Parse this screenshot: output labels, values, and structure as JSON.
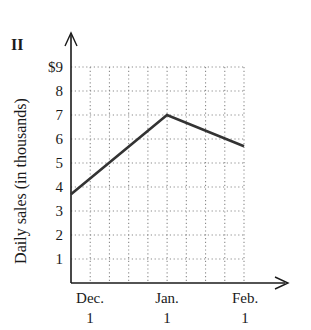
{
  "panel_label": "II",
  "chart_data": {
    "type": "line",
    "title": "",
    "xlabel": "",
    "ylabel": "Daily sales (in thousands)",
    "x_tick_labels": [
      {
        "line1": "Dec.",
        "line2": "1"
      },
      {
        "line1": "Jan.",
        "line2": "1"
      },
      {
        "line1": "Feb.",
        "line2": "1"
      }
    ],
    "categories": [
      "Dec. 1",
      "Jan. 1",
      "Feb. 1"
    ],
    "y_tick_labels": [
      "1",
      "2",
      "3",
      "4",
      "5",
      "6",
      "7",
      "8",
      "$9"
    ],
    "ylim": [
      0,
      9
    ],
    "grid": true,
    "grid_style": "dotted",
    "series": [
      {
        "name": "Daily sales",
        "values": [
          3.7,
          7.0,
          5.7
        ]
      }
    ],
    "colors": {
      "line": "#333333",
      "axis": "#1a1a1a",
      "grid": "#8a8a8a"
    }
  }
}
